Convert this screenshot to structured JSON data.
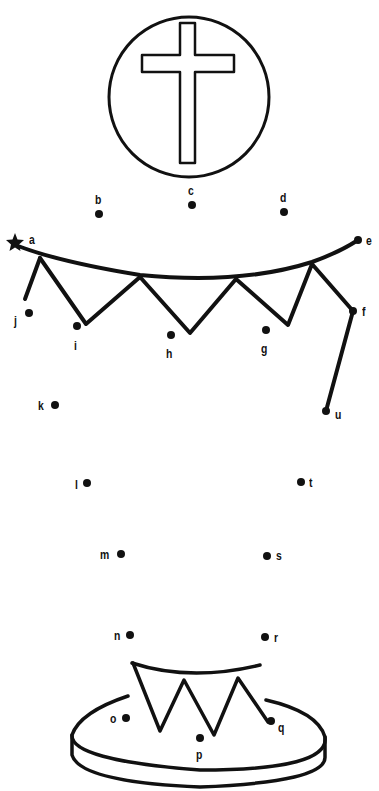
{
  "puzzle": {
    "type": "dot-to-dot",
    "subject": "cake with cross emblem",
    "start_marker": "star-icon",
    "ink_color": "#111111",
    "background": "#ffffff"
  },
  "dots": [
    {
      "label": "a",
      "x": 15,
      "y": 243
    },
    {
      "label": "b",
      "x": 99,
      "y": 214
    },
    {
      "label": "c",
      "x": 192,
      "y": 205
    },
    {
      "label": "d",
      "x": 284,
      "y": 212
    },
    {
      "label": "e",
      "x": 358,
      "y": 240
    },
    {
      "label": "f",
      "x": 353,
      "y": 311
    },
    {
      "label": "g",
      "x": 266,
      "y": 330
    },
    {
      "label": "h",
      "x": 171,
      "y": 335
    },
    {
      "label": "i",
      "x": 77,
      "y": 326
    },
    {
      "label": "j",
      "x": 29,
      "y": 313
    },
    {
      "label": "k",
      "x": 55,
      "y": 405
    },
    {
      "label": "l",
      "x": 87,
      "y": 483
    },
    {
      "label": "m",
      "x": 121,
      "y": 554
    },
    {
      "label": "n",
      "x": 130,
      "y": 635
    },
    {
      "label": "o",
      "x": 126,
      "y": 718
    },
    {
      "label": "p",
      "x": 200,
      "y": 738
    },
    {
      "label": "q",
      "x": 271,
      "y": 721
    },
    {
      "label": "r",
      "x": 265,
      "y": 637
    },
    {
      "label": "s",
      "x": 267,
      "y": 556
    },
    {
      "label": "t",
      "x": 301,
      "y": 482
    },
    {
      "label": "u",
      "x": 326,
      "y": 411
    }
  ]
}
